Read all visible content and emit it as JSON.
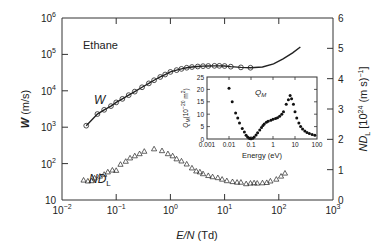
{
  "chart_data": [
    {
      "type": "scatter",
      "title": "Ethane",
      "xlabel": "E/N (Td)",
      "xscale": "log",
      "xlim": [
        0.01,
        1000
      ],
      "xticks": [
        "10^-2",
        "10^-1",
        "10^0",
        "10^1",
        "10^2",
        "10^3"
      ],
      "ylabel_left": "W (m/s)",
      "yscale_left": "log",
      "ylim_left": [
        10,
        1000000
      ],
      "yticks_left": [
        "10",
        "10^2",
        "10^3",
        "10^4",
        "10^5",
        "10^6"
      ],
      "ylabel_right": "ND_L [10^24 (m s)^-1]",
      "ylim_right": [
        0,
        6
      ],
      "yticks_right": [
        "0",
        "1",
        "2",
        "3",
        "4",
        "5",
        "6"
      ],
      "grid": false,
      "series": [
        {
          "name": "W",
          "axis": "left",
          "style": "open circles + solid line",
          "x": [
            0.028,
            0.045,
            0.06,
            0.08,
            0.1,
            0.13,
            0.17,
            0.22,
            0.3,
            0.4,
            0.5,
            0.65,
            0.8,
            1.0,
            1.3,
            1.6,
            2.0,
            2.5,
            3.2,
            4.0,
            5.0,
            6.5,
            8.0,
            10,
            13,
            20,
            30
          ],
          "y": [
            1100,
            2300,
            3000,
            3800,
            4800,
            6000,
            7600,
            9500,
            12500,
            16000,
            19500,
            24000,
            28000,
            33000,
            37000,
            40000,
            43000,
            45000,
            46500,
            47500,
            48000,
            48500,
            48500,
            48000,
            46000,
            44000,
            43000
          ]
        },
        {
          "name": "W (calculated line, extended)",
          "axis": "left",
          "style": "solid line",
          "x": [
            30,
            50,
            80,
            120,
            180,
            250
          ],
          "y": [
            43000,
            45000,
            55000,
            75000,
            110000,
            160000
          ]
        },
        {
          "name": "ND_L",
          "axis": "right",
          "style": "open triangles",
          "x": [
            0.025,
            0.03,
            0.035,
            0.04,
            0.05,
            0.06,
            0.07,
            0.085,
            0.1,
            0.12,
            0.15,
            0.18,
            0.22,
            0.27,
            0.33,
            0.5,
            0.7,
            0.9,
            1.1,
            1.3,
            1.6,
            2.0,
            2.5,
            3.0,
            3.5,
            4.0,
            5.0,
            6.0,
            7.5,
            9.0,
            11,
            14,
            17,
            20,
            25,
            30,
            35,
            40,
            50,
            60,
            70,
            90,
            110,
            130
          ],
          "y": [
            0.65,
            0.62,
            0.63,
            0.72,
            0.78,
            0.84,
            0.92,
            0.98,
            0.97,
            1.17,
            1.27,
            1.38,
            1.45,
            1.52,
            1.6,
            1.68,
            1.62,
            1.52,
            1.45,
            1.35,
            1.28,
            1.18,
            1.05,
            0.95,
            0.92,
            0.86,
            0.8,
            0.76,
            0.73,
            0.68,
            0.63,
            0.6,
            0.58,
            0.58,
            0.53,
            0.55,
            0.56,
            0.55,
            0.56,
            0.57,
            0.62,
            0.68,
            0.78,
            0.88
          ]
        }
      ],
      "annotations": [
        "Ethane",
        "W",
        "ND_L"
      ]
    },
    {
      "type": "scatter",
      "title": "Q_M",
      "inset": true,
      "xlabel": "Energy (eV)",
      "xscale": "log",
      "xlim": [
        0.001,
        100
      ],
      "xticks": [
        "0.001",
        "0.01",
        "0.1",
        "1",
        "10",
        "100"
      ],
      "ylabel": "Q_M (10^-20 m^2)",
      "ylim": [
        0,
        25
      ],
      "yticks": [
        "0",
        "5",
        "10",
        "15",
        "20",
        "25"
      ],
      "series": [
        {
          "name": "Q_M",
          "style": "filled circles",
          "x": [
            0.01,
            0.014,
            0.02,
            0.025,
            0.03,
            0.04,
            0.05,
            0.06,
            0.07,
            0.08,
            0.09,
            0.1,
            0.12,
            0.14,
            0.17,
            0.2,
            0.25,
            0.3,
            0.35,
            0.4,
            0.5,
            0.6,
            0.8,
            1.0,
            1.3,
            1.6,
            2.0,
            2.5,
            3.0,
            4.0,
            5.0,
            6.0,
            7.0,
            8.5,
            10,
            12,
            15,
            18,
            22,
            28,
            35,
            45,
            60,
            80
          ],
          "y": [
            20.5,
            15,
            10.5,
            8.5,
            6.5,
            4.2,
            2.8,
            1.5,
            0.8,
            0.4,
            0.2,
            0.1,
            0.3,
            0.8,
            1.6,
            2.5,
            3.6,
            4.6,
            5.4,
            6.0,
            6.8,
            7.2,
            7.6,
            8.0,
            8.3,
            8.6,
            9.2,
            10,
            11,
            14,
            15.8,
            17.5,
            16.2,
            14,
            11,
            8.5,
            6.5,
            5,
            4,
            3.2,
            2.6,
            2.2,
            1.8,
            1.5
          ]
        }
      ]
    }
  ],
  "labels": {
    "title": "Ethane",
    "w_series": "W",
    "ndl_series_base": "ND",
    "ndl_series_sub": "L",
    "x_axis_italic": "E/N",
    "x_axis_unit": " (Td)",
    "left_axis_italic": "W",
    "left_axis_unit": " (m/s)",
    "right_axis": "ND",
    "right_axis_sub": "L",
    "right_axis_rest": " [10",
    "right_axis_exp": "24",
    "right_axis_tail": " (m s)",
    "right_axis_tail_exp": "−1",
    "right_axis_close": "]",
    "inset_title": "Q",
    "inset_title_sub": "M",
    "inset_xlabel": "Energy (eV)",
    "inset_ylabel": "Q",
    "inset_ylabel_sub": "M",
    "inset_ylabel_rest": "(10",
    "inset_ylabel_exp": "−20",
    "inset_ylabel_tail": " m",
    "inset_ylabel_tail_exp": "2",
    "inset_ylabel_close": ")",
    "x_tick_base": [
      "10",
      "10",
      "10",
      "10",
      "10",
      "10"
    ],
    "x_tick_exp": [
      "−2",
      "−1",
      "0",
      "1",
      "2",
      "3"
    ],
    "left_tick_base": [
      "10",
      "10",
      "10",
      "10",
      "10",
      "10"
    ],
    "left_tick_exp": [
      "",
      "2",
      "3",
      "4",
      "5",
      "6"
    ],
    "right_ticks": [
      "0",
      "1",
      "2",
      "3",
      "4",
      "5",
      "6"
    ],
    "inset_x_ticks": [
      "0.001",
      "0.01",
      "0.1",
      "1",
      "10",
      "100"
    ],
    "inset_y_ticks": [
      "0",
      "5",
      "10",
      "15",
      "20",
      "25"
    ]
  }
}
